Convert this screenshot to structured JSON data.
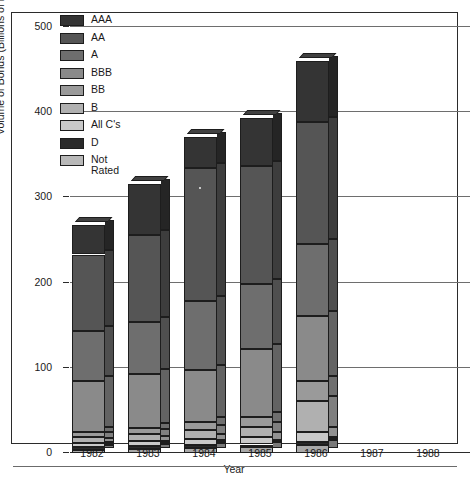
{
  "chart_data": {
    "type": "bar",
    "stacked": true,
    "three_d": true,
    "title": "",
    "xlabel": "Year",
    "ylabel": "Volume of Bonds (Billions of Dollars)",
    "categories": [
      "1982",
      "1983",
      "1984",
      "1985",
      "1986",
      "1987",
      "1988"
    ],
    "ylim": [
      0,
      500
    ],
    "yticks": [
      0,
      100,
      200,
      300,
      400,
      500
    ],
    "ytick_labels": [
      "0",
      "100",
      "200",
      "300",
      "400",
      "500"
    ],
    "grid": true,
    "legend_position": "inside-top-left",
    "legend_entries": [
      "AAA",
      "AA",
      "A",
      "BBB",
      "BB",
      "B",
      "All C's",
      "D",
      "Not\nRated"
    ],
    "series": [
      {
        "name": "Not Rated",
        "color": "#a8a8a8",
        "values": [
          4,
          5,
          6,
          7,
          9,
          null,
          null
        ]
      },
      {
        "name": "D",
        "color": "#2a2a2a",
        "values": [
          3,
          3,
          3,
          3,
          4,
          null,
          null
        ]
      },
      {
        "name": "All C's",
        "color": "#c9c9c9",
        "values": [
          5,
          6,
          8,
          9,
          12,
          null,
          null
        ]
      },
      {
        "name": "B",
        "color": "#b0b0b0",
        "values": [
          7,
          8,
          10,
          12,
          36,
          null,
          null
        ]
      },
      {
        "name": "BB",
        "color": "#9a9a9a",
        "values": [
          6,
          7,
          9,
          11,
          23,
          null,
          null
        ]
      },
      {
        "name": "BBB",
        "color": "#8a8a8a",
        "values": [
          60,
          64,
          62,
          80,
          77,
          null,
          null
        ]
      },
      {
        "name": "A",
        "color": "#6e6e6e",
        "values": [
          58,
          61,
          81,
          76,
          84,
          null,
          null
        ]
      },
      {
        "name": "AA",
        "color": "#555555",
        "values": [
          90,
          102,
          156,
          139,
          144,
          null,
          null
        ]
      },
      {
        "name": "AAA",
        "color": "#343434",
        "values": [
          35,
          60,
          36,
          56,
          71,
          null,
          null
        ]
      }
    ],
    "totals": [
      268,
      316,
      371,
      393,
      460,
      null,
      null
    ],
    "bars_present": [
      "1982",
      "1983",
      "1984",
      "1985",
      "1986"
    ]
  },
  "legend": {
    "items": [
      {
        "label": "AAA",
        "color": "#343434"
      },
      {
        "label": "AA",
        "color": "#555555"
      },
      {
        "label": "A",
        "color": "#6e6e6e"
      },
      {
        "label": "BBB",
        "color": "#8a8a8a"
      },
      {
        "label": "BB",
        "color": "#9a9a9a"
      },
      {
        "label": "B",
        "color": "#b0b0b0"
      },
      {
        "label": "All C's",
        "color": "#c9c9c9"
      },
      {
        "label": "D",
        "color": "#2a2a2a"
      },
      {
        "label": "Not\nRated",
        "color": "#b8b8b8"
      }
    ]
  },
  "axes": {
    "y_title": "Volume of Bonds (Billions of Dollars)",
    "x_title": "Year",
    "y_ticks": [
      "500",
      "400",
      "300",
      "200",
      "100",
      "0"
    ],
    "x_ticks": [
      "1982",
      "1983",
      "1984",
      "1985",
      "1986",
      "1987",
      "1988"
    ]
  },
  "colors": {
    "frame": "#2b2b2b",
    "grid": "#6e6e6e",
    "background": "#ffffff",
    "text": "#1a1a1a",
    "bar_outline": "#1d1d1d"
  }
}
